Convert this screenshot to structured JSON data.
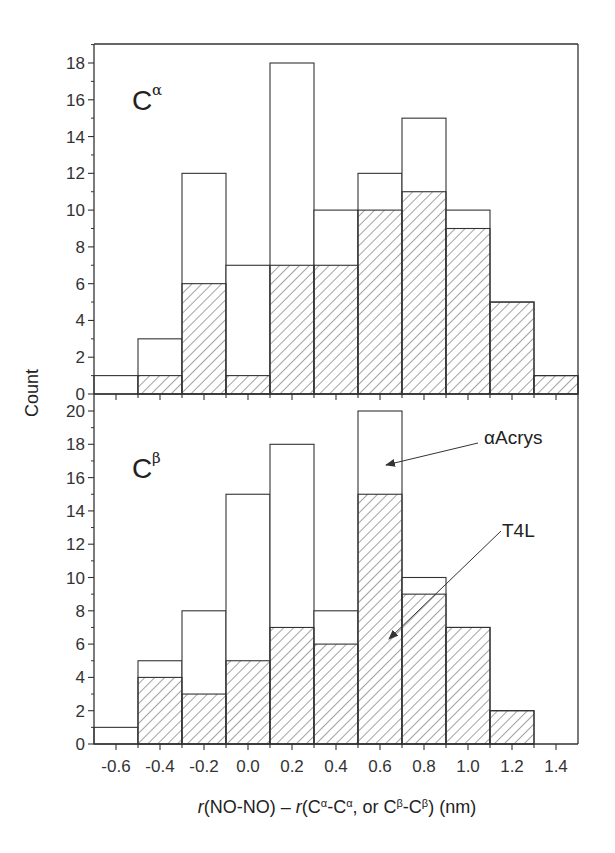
{
  "chart_data": [
    {
      "type": "bar",
      "subtype": "overlaid-histogram",
      "panel": "top",
      "panel_label": "C",
      "panel_label_sup": "α",
      "bin_edges": [
        -0.7,
        -0.5,
        -0.3,
        -0.1,
        0.1,
        0.3,
        0.5,
        0.7,
        0.9,
        1.1,
        1.3,
        1.5
      ],
      "series": [
        {
          "name": "αAcrys",
          "style": "open",
          "values": [
            1,
            3,
            12,
            7,
            18,
            10,
            12,
            15,
            10,
            5,
            1
          ]
        },
        {
          "name": "T4L",
          "style": "hatched",
          "values": [
            0,
            1,
            6,
            1,
            7,
            7,
            10,
            11,
            9,
            5,
            1
          ]
        }
      ],
      "ylim": [
        0,
        19
      ],
      "yticks": [
        0,
        2,
        4,
        6,
        8,
        10,
        12,
        14,
        16,
        18
      ],
      "xlim": [
        -0.7,
        1.5
      ]
    },
    {
      "type": "bar",
      "subtype": "overlaid-histogram",
      "panel": "bottom",
      "panel_label": "C",
      "panel_label_sup": "β",
      "bin_edges": [
        -0.7,
        -0.5,
        -0.3,
        -0.1,
        0.1,
        0.3,
        0.5,
        0.7,
        0.9,
        1.1,
        1.3,
        1.5
      ],
      "series": [
        {
          "name": "αAcrys",
          "style": "open",
          "values": [
            1,
            5,
            8,
            15,
            18,
            8,
            20,
            10,
            7,
            2,
            0
          ]
        },
        {
          "name": "T4L",
          "style": "hatched",
          "values": [
            0,
            4,
            3,
            5,
            7,
            6,
            15,
            9,
            7,
            2,
            0
          ]
        }
      ],
      "ylim": [
        0,
        20
      ],
      "yticks": [
        0,
        2,
        4,
        6,
        8,
        10,
        12,
        14,
        16,
        18,
        20
      ],
      "xlim": [
        -0.7,
        1.5
      ],
      "annotations": [
        {
          "text": "αAcrys",
          "points_to": "open bar at 0.5–0.7"
        },
        {
          "text": "T4L",
          "points_to": "hatched bar at 0.5–0.7"
        }
      ]
    }
  ],
  "axes": {
    "ylabel": "Count",
    "xlabel_parts": [
      "r",
      "(NO-NO) – ",
      "r",
      "(C",
      "α",
      "-C",
      "α",
      ", or C",
      "β",
      "-C",
      "β",
      ")   (nm)"
    ],
    "xlabel": "r(NO-NO) – r(Cα-Cα, or Cβ-Cβ)   (nm)",
    "xticks": [
      "-0.6",
      "-0.4",
      "-0.2",
      "0.0",
      "0.2",
      "0.4",
      "0.6",
      "0.8",
      "1.0",
      "1.2",
      "1.4"
    ]
  },
  "annotations": {
    "acrys": "αAcrys",
    "t4l": "T4L"
  },
  "colors": {
    "line": "#333333",
    "hatch": "#555555",
    "background": "#ffffff"
  }
}
